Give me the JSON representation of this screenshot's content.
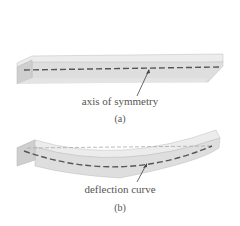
{
  "figure_a": {
    "label": "axis of symmetry",
    "caption": "(a)",
    "beam_state": "straight"
  },
  "figure_b": {
    "label": "deflection curve",
    "caption": "(b)",
    "beam_state": "deflected"
  },
  "colors": {
    "beam_top": "#e6e6e6",
    "beam_front": "#d9d9d9",
    "beam_end": "#cccccc",
    "dashed_line": "#555555",
    "reference_line": "#aaaaaa",
    "text": "#555555"
  }
}
